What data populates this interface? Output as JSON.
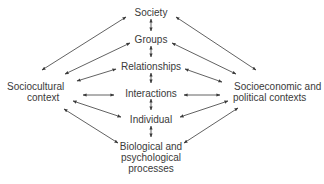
{
  "diagram": {
    "type": "relationship-diagram",
    "center_column": [
      {
        "id": "society",
        "label": "Society"
      },
      {
        "id": "groups",
        "label": "Groups"
      },
      {
        "id": "relationships",
        "label": "Relationships"
      },
      {
        "id": "interactions",
        "label": "Interactions"
      },
      {
        "id": "individual",
        "label": "Individual"
      },
      {
        "id": "biological",
        "label_lines": [
          "Biological and",
          "psychological",
          "processes"
        ]
      }
    ],
    "left_node": {
      "id": "sociocultural",
      "label_lines": [
        "Sociocultural",
        "context"
      ]
    },
    "right_node": {
      "id": "socioeconomic",
      "label_lines": [
        "Socioeconomic and",
        "political contexts"
      ]
    },
    "edges": "bidirectional arrows between vertically adjacent center nodes, and from each center node to both left and right context nodes",
    "colors": {
      "text": "#3a3a3a",
      "arrow": "#3a3a3a",
      "background": "#ffffff"
    }
  }
}
